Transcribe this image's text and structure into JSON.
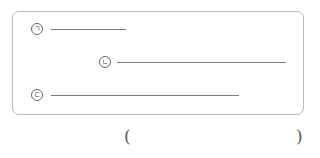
{
  "figure": {
    "segments": [
      {
        "label": "ㄱ",
        "marker_icon": "circled-giyeok",
        "marker_x": 31,
        "marker_y": 23,
        "line_start_x": 51,
        "line_end_x": 126
      },
      {
        "label": "ㄴ",
        "marker_icon": "circled-nieun",
        "marker_x": 99,
        "marker_y": 56,
        "line_start_x": 117,
        "line_end_x": 286
      },
      {
        "label": "ㄷ",
        "marker_icon": "circled-digeut",
        "marker_x": 31,
        "marker_y": 89,
        "line_start_x": 51,
        "line_end_x": 239
      }
    ],
    "line_color": "#7a7a7a",
    "border_color": "#b9b9b9"
  },
  "answer": {
    "open_paren": "(",
    "close_paren": ")",
    "value": ""
  }
}
